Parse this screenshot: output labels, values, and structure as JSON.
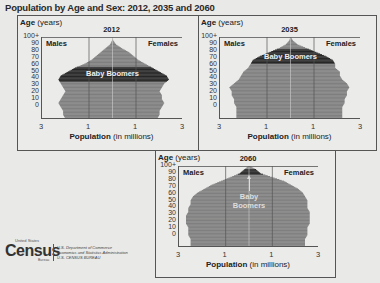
{
  "title": "Population by Age and Sex: 2012, 2035 and 2060",
  "labels": {
    "age_bold": "Age",
    "age_unit": "(years)",
    "males": "Males",
    "females": "Females",
    "xlabel_bold": "Population",
    "xlabel_unit": "(in millions)",
    "baby_boomers": "Baby Boomers",
    "baby": "Baby",
    "boomers": "Boomers"
  },
  "yticks": [
    "100+",
    "90",
    "80",
    "70",
    "60",
    "50",
    "40",
    "30",
    "20",
    "10",
    "0"
  ],
  "xticks": [
    "3",
    "1",
    "1",
    "3"
  ],
  "logo": {
    "word": "Census",
    "sup": "United States",
    "sub": "Bureau",
    "line1": "U.S. Department of Commerce",
    "line2": "Economics and Statistics Administration",
    "line3": "U.S. CENSUS BUREAU"
  },
  "colors": {
    "population": "#7a7a7a",
    "baby_boomers": "#1e1e1e",
    "background": "#e9e9e7"
  },
  "chart_data": [
    {
      "type": "bar",
      "subtype": "population-pyramid",
      "title": "2012",
      "xlabel": "Population (in millions)",
      "ylabel": "Age (years)",
      "xlim": [
        -3,
        3
      ],
      "xticks": [
        -3,
        -1,
        1,
        3
      ],
      "ylim": [
        0,
        100
      ],
      "age_groups": [
        0,
        5,
        10,
        15,
        20,
        25,
        30,
        35,
        40,
        45,
        50,
        55,
        60,
        65,
        70,
        75,
        80,
        85,
        90,
        95,
        100
      ],
      "series": [
        {
          "name": "Males",
          "values": [
            2.0,
            2.1,
            2.1,
            2.2,
            2.3,
            2.2,
            2.1,
            2.0,
            2.1,
            2.2,
            2.3,
            2.2,
            1.9,
            1.6,
            1.2,
            0.9,
            0.7,
            0.5,
            0.3,
            0.1,
            0.02
          ]
        },
        {
          "name": "Females",
          "values": [
            1.9,
            2.0,
            2.0,
            2.1,
            2.2,
            2.1,
            2.1,
            2.0,
            2.1,
            2.2,
            2.4,
            2.3,
            2.0,
            1.7,
            1.4,
            1.1,
            0.9,
            0.7,
            0.4,
            0.15,
            0.03
          ]
        }
      ],
      "annotations": [
        {
          "text": "Baby Boomers",
          "age_range": [
            48,
            66
          ]
        }
      ],
      "legend": [
        "Males",
        "Females"
      ]
    },
    {
      "type": "bar",
      "subtype": "population-pyramid",
      "title": "2035",
      "xlabel": "Population (in millions)",
      "ylabel": "Age (years)",
      "xlim": [
        -3,
        3
      ],
      "xticks": [
        -3,
        -1,
        1,
        3
      ],
      "ylim": [
        0,
        100
      ],
      "age_groups": [
        0,
        5,
        10,
        15,
        20,
        25,
        30,
        35,
        40,
        45,
        50,
        55,
        60,
        65,
        70,
        75,
        80,
        85,
        90,
        95,
        100
      ],
      "series": [
        {
          "name": "Males",
          "values": [
            2.3,
            2.3,
            2.3,
            2.3,
            2.4,
            2.4,
            2.5,
            2.5,
            2.6,
            2.4,
            2.2,
            2.1,
            2.0,
            1.8,
            1.7,
            1.6,
            1.3,
            0.9,
            0.5,
            0.2,
            0.05
          ]
        },
        {
          "name": "Females",
          "values": [
            2.2,
            2.2,
            2.2,
            2.2,
            2.3,
            2.3,
            2.4,
            2.4,
            2.5,
            2.4,
            2.2,
            2.1,
            2.1,
            1.9,
            1.9,
            1.8,
            1.5,
            1.1,
            0.7,
            0.3,
            0.1
          ]
        }
      ],
      "annotations": [
        {
          "text": "Baby Boomers",
          "age_range": [
            71,
            89
          ]
        }
      ],
      "legend": [
        "Males",
        "Females"
      ]
    },
    {
      "type": "bar",
      "subtype": "population-pyramid",
      "title": "2060",
      "xlabel": "Population (in millions)",
      "ylabel": "Age (years)",
      "xlim": [
        -3,
        3
      ],
      "xticks": [
        -3,
        -1,
        1,
        3
      ],
      "ylim": [
        0,
        100
      ],
      "age_groups": [
        0,
        5,
        10,
        15,
        20,
        25,
        30,
        35,
        40,
        45,
        50,
        55,
        60,
        65,
        70,
        75,
        80,
        85,
        90,
        95,
        100
      ],
      "series": [
        {
          "name": "Males",
          "values": [
            2.5,
            2.5,
            2.5,
            2.6,
            2.6,
            2.6,
            2.7,
            2.7,
            2.7,
            2.6,
            2.6,
            2.5,
            2.5,
            2.4,
            2.2,
            1.9,
            1.6,
            1.2,
            0.8,
            0.4,
            0.2
          ]
        },
        {
          "name": "Females",
          "values": [
            2.4,
            2.4,
            2.4,
            2.5,
            2.5,
            2.5,
            2.6,
            2.6,
            2.6,
            2.6,
            2.5,
            2.5,
            2.5,
            2.4,
            2.3,
            2.1,
            1.8,
            1.5,
            1.0,
            0.5,
            0.3
          ]
        }
      ],
      "annotations": [
        {
          "text": "Baby Boomers",
          "age_range": [
            94,
            100
          ]
        }
      ],
      "legend": [
        "Males",
        "Females"
      ]
    }
  ]
}
